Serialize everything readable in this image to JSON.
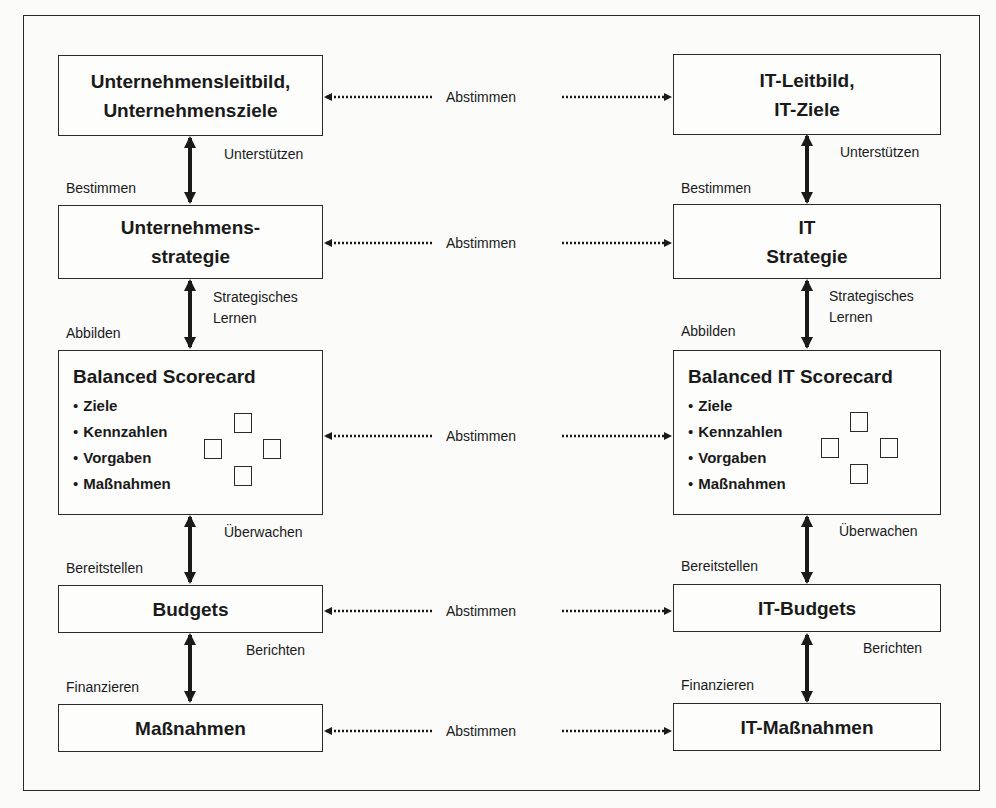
{
  "left_column": {
    "boxes": [
      {
        "line1": "Unternehmensleitbild,",
        "line2": "Unternehmensziele"
      },
      {
        "line1": "Unternehmens-",
        "line2": "strategie"
      },
      {
        "title": "Balanced Scorecard",
        "items": [
          "Ziele",
          "Kennzahlen",
          "Vorgaben",
          "Maßnahmen"
        ]
      },
      {
        "line1": "Budgets"
      },
      {
        "line1": "Maßnahmen"
      }
    ],
    "down_labels": [
      "Bestimmen",
      "Abbilden",
      "Bereitstellen",
      "Finanzieren"
    ],
    "up_labels": [
      "Unterstützen",
      "Strategisches",
      "Lernen",
      "Überwachen",
      "Berichten"
    ]
  },
  "right_column": {
    "boxes": [
      {
        "line1": "IT-Leitbild,",
        "line2": "IT-Ziele"
      },
      {
        "line1": "IT",
        "line2": "Strategie"
      },
      {
        "title": "Balanced IT Scorecard",
        "items": [
          "Ziele",
          "Kennzahlen",
          "Vorgaben",
          "Maßnahmen"
        ]
      },
      {
        "line1": "IT-Budgets"
      },
      {
        "line1": "IT-Maßnahmen"
      }
    ],
    "down_labels": [
      "Bestimmen",
      "Abbilden",
      "Bereitstellen",
      "Finanzieren"
    ],
    "up_labels": [
      "Unterstützen",
      "Strategisches",
      "Lernen",
      "Überwachen",
      "Berichten"
    ]
  },
  "alignment_labels": [
    "Abstimmen",
    "Abstimmen",
    "Abstimmen",
    "Abstimmen",
    "Abstimmen"
  ]
}
